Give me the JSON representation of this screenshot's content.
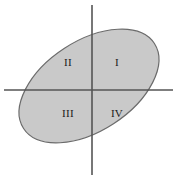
{
  "figure": {
    "background_color": "#ffffff",
    "width": 177,
    "height": 180
  },
  "axes": {
    "x_axis": {
      "name": "horizontal-axis",
      "color": "#555555",
      "stroke_width": 1.6,
      "y": 90,
      "x_start": 4,
      "x_end": 173
    },
    "y_axis": {
      "name": "vertical-axis",
      "color": "#555555",
      "stroke_width": 1.6,
      "x": 92,
      "y_start": 5,
      "y_end": 175
    },
    "origin": {
      "x": 92,
      "y": 90
    }
  },
  "ellipse": {
    "name": "shaded-ellipse",
    "fill_color": "#c9c9c9",
    "stroke_color": "#6b6b6b",
    "stroke_width": 1.2,
    "center_x": 89,
    "center_y": 86,
    "radius_x": 78,
    "radius_y": 45,
    "rotation_deg": -33
  },
  "quadrant_labels": [
    {
      "id": "quadrant-1",
      "text": "I",
      "x": 117,
      "y": 63
    },
    {
      "id": "quadrant-2",
      "text": "II",
      "x": 68,
      "y": 63
    },
    {
      "id": "quadrant-3",
      "text": "III",
      "x": 68,
      "y": 114
    },
    {
      "id": "quadrant-4",
      "text": "IV",
      "x": 117,
      "y": 114
    }
  ]
}
